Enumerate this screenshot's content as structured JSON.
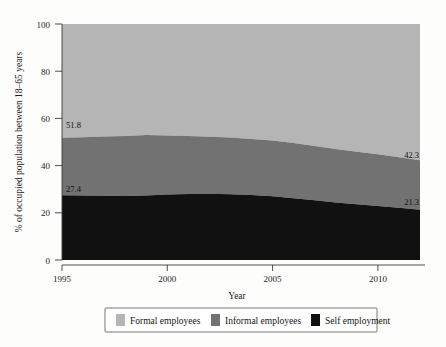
{
  "chart_data": {
    "type": "area",
    "subtype": "stacked-area-100",
    "title": "",
    "xlabel": "Year",
    "ylabel": "% of occupied population between 18–65 years",
    "xlim": [
      1995,
      2012
    ],
    "ylim": [
      0,
      100
    ],
    "grid": false,
    "legend_position": "bottom",
    "x_ticks": [
      1995,
      2000,
      2005,
      2010
    ],
    "x_tick_labels": [
      "1995",
      "2000",
      "2005",
      "2010"
    ],
    "y_ticks": [
      0,
      20,
      40,
      60,
      80,
      100
    ],
    "y_tick_labels": [
      "0",
      "20",
      "40",
      "60",
      "80",
      "100"
    ],
    "x": [
      1995,
      1996,
      1997,
      1998,
      1999,
      2000,
      2001,
      2002,
      2003,
      2004,
      2005,
      2006,
      2007,
      2008,
      2009,
      2010,
      2011,
      2012
    ],
    "series": [
      {
        "name": "Self employment",
        "color": "#111111",
        "values": [
          27.4,
          27.3,
          27.2,
          27.1,
          27.3,
          27.8,
          28.0,
          28.1,
          27.9,
          27.5,
          27.0,
          26.2,
          25.3,
          24.4,
          23.6,
          22.9,
          22.1,
          21.3
        ]
      },
      {
        "name": "Informal employees",
        "color": "#727272",
        "values": [
          24.4,
          24.7,
          25.1,
          25.4,
          25.7,
          25.0,
          24.5,
          24.1,
          24.0,
          23.8,
          23.6,
          23.4,
          23.0,
          22.6,
          22.3,
          21.9,
          21.4,
          21.0
        ]
      },
      {
        "name": "Formal employees",
        "color": "#b5b5b5",
        "values": [
          48.2,
          48.0,
          47.7,
          47.5,
          47.0,
          47.2,
          47.5,
          47.8,
          48.1,
          48.7,
          49.4,
          50.4,
          51.7,
          53.0,
          54.1,
          55.2,
          56.5,
          57.7
        ]
      }
    ],
    "cumulative_boundaries": {
      "self_employment_top": [
        27.4,
        27.3,
        27.2,
        27.1,
        27.3,
        27.8,
        28.0,
        28.1,
        27.9,
        27.5,
        27.0,
        26.2,
        25.3,
        24.4,
        23.6,
        22.9,
        22.1,
        21.3
      ],
      "informal_top": [
        51.8,
        52.0,
        52.3,
        52.5,
        53.0,
        52.8,
        52.5,
        52.2,
        51.9,
        51.3,
        50.6,
        49.6,
        48.3,
        47.0,
        45.9,
        44.8,
        43.5,
        42.3
      ]
    },
    "annotations": [
      {
        "text": "51.8",
        "x": 1995,
        "y": 51.8,
        "anchor": "start"
      },
      {
        "text": "27.4",
        "x": 1995,
        "y": 27.4,
        "anchor": "start"
      },
      {
        "text": "42.3",
        "x": 2012,
        "y": 42.3,
        "anchor": "end"
      },
      {
        "text": "21.3",
        "x": 2012,
        "y": 21.3,
        "anchor": "end"
      }
    ],
    "legend": [
      {
        "label": "Formal employees",
        "color": "#b5b5b5"
      },
      {
        "label": "Informal employees",
        "color": "#727272"
      },
      {
        "label": "Self employment",
        "color": "#111111"
      }
    ]
  },
  "axes": {
    "y_label": "% of occupied population between 18–65 years",
    "x_label": "Year",
    "y_ticks": [
      "100",
      "80",
      "60",
      "40",
      "20",
      "0"
    ],
    "x_ticks": [
      "1995",
      "2000",
      "2005",
      "2010"
    ]
  },
  "labels": {
    "top_left": "51.8",
    "bottom_left": "27.4",
    "top_right": "42.3",
    "bottom_right": "21.3"
  },
  "legend": {
    "items": [
      {
        "label": "Formal employees"
      },
      {
        "label": "Informal employees"
      },
      {
        "label": "Self employment"
      }
    ]
  }
}
